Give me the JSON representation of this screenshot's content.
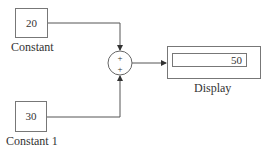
{
  "blocks": {
    "constant": {
      "name": "Constant",
      "value": "20"
    },
    "constant1": {
      "name": "Constant 1",
      "value": "30"
    },
    "sum": {
      "signs": [
        "+",
        "+"
      ]
    },
    "display": {
      "name": "Display",
      "value": "50"
    }
  },
  "colors": {
    "line": "#555555",
    "border": "#777777"
  }
}
